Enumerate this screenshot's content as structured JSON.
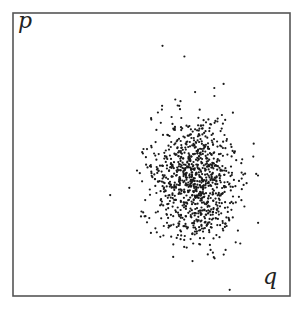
{
  "chart_data": {
    "type": "scatter",
    "title": "",
    "xlabel": "q",
    "ylabel": "p",
    "grid": false,
    "legend": null,
    "frame": {
      "left": 13,
      "top": 13,
      "right": 290,
      "bottom": 296,
      "color": "#555555"
    },
    "cloud": {
      "count": 1000,
      "center_x": 195,
      "center_y": 180,
      "sigma_x": 21,
      "sigma_y": 32,
      "point_radius": 1.1,
      "point_color": "#1a1a1a",
      "seed": 12345
    }
  },
  "labels": {
    "y_axis": "p",
    "x_axis": "q"
  }
}
